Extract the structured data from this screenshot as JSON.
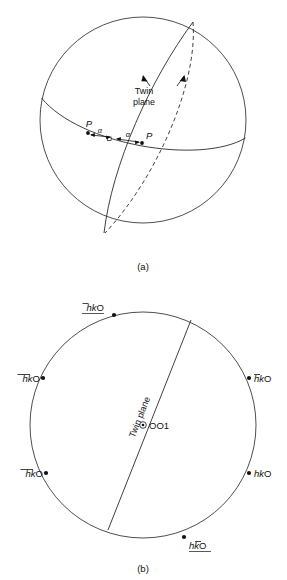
{
  "figure": {
    "background_color": "#ffffff",
    "line_color": "#2a2a2a",
    "text_color": "#111111"
  },
  "panel_a": {
    "caption": "(a)",
    "twin_plane_label_line1": "Twin",
    "twin_plane_label_line2": "plane",
    "pole_left_label": "P",
    "pole_right_label": "P",
    "angle_left_label": "α",
    "angle_right_label": "α",
    "sphere": {
      "center_x": 143,
      "center_y": 120,
      "radius": 103
    },
    "elements": [
      "sphere-outline",
      "twin-plane-great-circle-solid",
      "twin-plane-great-circle-dashed",
      "equator-great-circle",
      "pole-dot-left",
      "pole-dot-right",
      "open-square-marker",
      "angle-arrow-left",
      "angle-arrow-right",
      "twin-plane-leader-solid",
      "twin-plane-leader-dashed"
    ]
  },
  "panel_b": {
    "caption": "(b)",
    "twin_plane_label": "Twin plane",
    "center_label": "OO1",
    "center_symbol": "circled-dot",
    "projection": {
      "center_x": 143,
      "center_y": 425,
      "radius": 113
    },
    "poles": [
      {
        "id": "pole-top",
        "label": "hkO",
        "bar_over": [
          "h"
        ],
        "underline": true,
        "x": 114,
        "y": 315,
        "label_x": 104,
        "label_y": 309,
        "anchor": "end"
      },
      {
        "id": "pole-left-upper",
        "label": "hkO",
        "bar_over": [
          "h",
          "k"
        ],
        "underline": false,
        "x": 43,
        "y": 378,
        "label_x": 40,
        "label_y": 381,
        "anchor": "end"
      },
      {
        "id": "pole-left-lower",
        "label": "hkO",
        "bar_over": [
          "h",
          "k"
        ],
        "underline": false,
        "x": 46,
        "y": 473,
        "label_x": 43,
        "label_y": 476,
        "anchor": "end"
      },
      {
        "id": "pole-right-upper",
        "label": "hkO",
        "bar_over": [
          "h"
        ],
        "underline": false,
        "x": 249,
        "y": 378,
        "label_x": 254,
        "label_y": 381,
        "anchor": "start"
      },
      {
        "id": "pole-right-lower",
        "label": "hkO",
        "bar_over": [],
        "underline": false,
        "x": 249,
        "y": 473,
        "label_x": 254,
        "label_y": 476,
        "anchor": "start"
      },
      {
        "id": "pole-bottom",
        "label": "hkO",
        "bar_over": [
          "k"
        ],
        "underline": true,
        "x": 184,
        "y": 537,
        "label_x": 189,
        "label_y": 548,
        "anchor": "start"
      }
    ],
    "twin_plane_line": {
      "x1": 191,
      "y1": 320,
      "x2": 108,
      "y2": 530
    }
  }
}
